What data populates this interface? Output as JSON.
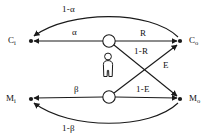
{
  "figure": {
    "type": "state-transition-diagram",
    "background_color": "#ffffff",
    "line_color": "#1a1a1a",
    "text_color": "#111111"
  },
  "nodes": [
    {
      "id": "Ci",
      "label_base": "C",
      "label_sub": "i",
      "role": "input-terminal",
      "shape": "filled-dot",
      "x": 28,
      "y": 41
    },
    {
      "id": "Co",
      "label_base": "C",
      "label_sub": "o",
      "role": "output-terminal",
      "shape": "filled-dot",
      "x": 183,
      "y": 41
    },
    {
      "id": "Mi",
      "label_base": "M",
      "label_sub": "i",
      "role": "input-terminal",
      "shape": "filled-dot",
      "x": 28,
      "y": 99
    },
    {
      "id": "Mo",
      "label_base": "M",
      "label_sub": "o",
      "role": "output-terminal",
      "shape": "filled-dot",
      "x": 183,
      "y": 99
    },
    {
      "id": "junction-top",
      "label_base": "",
      "label_sub": "",
      "role": "junction",
      "shape": "open-circle",
      "x": 109,
      "y": 41
    },
    {
      "id": "junction-bottom",
      "label_base": "",
      "label_sub": "",
      "role": "junction",
      "shape": "open-circle",
      "x": 109,
      "y": 97
    }
  ],
  "edge_labels": {
    "one_minus_alpha": "1-α",
    "alpha": "α",
    "r": "R",
    "one_minus_r": "1-R",
    "e": "E",
    "beta": "β",
    "one_minus_e": "1-E",
    "one_minus_beta": "1-β"
  },
  "center_icon": {
    "name": "person-icon",
    "description": "human figure silhouette"
  }
}
